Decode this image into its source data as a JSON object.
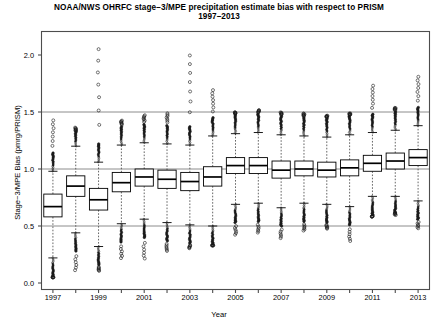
{
  "title": {
    "line1": "NOAA/NWS OHRFC stage−3/MPE precipitation estimate bias with respect to PRISM",
    "line2": "1997–2013"
  },
  "axes": {
    "xlabel": "Year",
    "ylabel": "Stage−3/MPE Bias (pmrg/PRISM)",
    "ytick_labels": [
      "0.0",
      "0.5",
      "1.0",
      "1.5",
      "2.0"
    ],
    "xtick_labels": [
      "1997",
      "1999",
      "2001",
      "2003",
      "2005",
      "2007",
      "2009",
      "2011",
      "2013"
    ]
  },
  "colors": {
    "frame": "#4d4d4d",
    "box": "#000000",
    "gridline": "#808080",
    "whisker": "#555555",
    "outlier": "#1a1a1a",
    "background": "#ffffff"
  },
  "chart_data": {
    "type": "boxplot",
    "title": "NOAA/NWS OHRFC stage−3/MPE precipitation estimate bias with respect to PRISM 1997–2013",
    "xlabel": "Year",
    "ylabel": "Stage−3/MPE Bias (pmrg/PRISM)",
    "ylim": [
      -0.05,
      2.25
    ],
    "yticks": [
      0.0,
      0.5,
      1.0,
      1.5,
      2.0
    ],
    "gridlines_y": [
      0.5,
      1.0,
      1.5
    ],
    "grid": true,
    "legend": "none",
    "categories": [
      1997,
      1998,
      1999,
      2000,
      2001,
      2002,
      2003,
      2004,
      2005,
      2006,
      2007,
      2008,
      2009,
      2010,
      2011,
      2012,
      2013
    ],
    "boxes": [
      {
        "year": 1997,
        "lower_whisker": 0.22,
        "q1": 0.58,
        "median": 0.67,
        "q3": 0.78,
        "upper_whisker": 0.98,
        "outliers_high_max": 1.46,
        "outliers_low_min": 0.05
      },
      {
        "year": 1998,
        "lower_whisker": 0.44,
        "q1": 0.76,
        "median": 0.85,
        "q3": 0.94,
        "upper_whisker": 1.2,
        "outliers_high_max": 1.33,
        "outliers_low_min": 0.09
      },
      {
        "year": 1999,
        "lower_whisker": 0.32,
        "q1": 0.64,
        "median": 0.73,
        "q3": 0.83,
        "upper_whisker": 1.06,
        "outliers_high_max": 2.15,
        "outliers_low_min": 0.1
      },
      {
        "year": 2000,
        "lower_whisker": 0.52,
        "q1": 0.8,
        "median": 0.88,
        "q3": 0.97,
        "upper_whisker": 1.21,
        "outliers_high_max": 1.43,
        "outliers_low_min": 0.2
      },
      {
        "year": 2001,
        "lower_whisker": 0.56,
        "q1": 0.85,
        "median": 0.93,
        "q3": 1.0,
        "upper_whisker": 1.23,
        "outliers_high_max": 1.48,
        "outliers_low_min": 0.19
      },
      {
        "year": 2002,
        "lower_whisker": 0.53,
        "q1": 0.83,
        "median": 0.91,
        "q3": 0.99,
        "upper_whisker": 1.22,
        "outliers_high_max": 1.5,
        "outliers_low_min": 0.27
      },
      {
        "year": 2003,
        "lower_whisker": 0.51,
        "q1": 0.81,
        "median": 0.89,
        "q3": 0.97,
        "upper_whisker": 1.21,
        "outliers_high_max": 2.07,
        "outliers_low_min": 0.3
      },
      {
        "year": 2004,
        "lower_whisker": 0.5,
        "q1": 0.85,
        "median": 0.93,
        "q3": 1.02,
        "upper_whisker": 1.29,
        "outliers_high_max": 1.72,
        "outliers_low_min": 0.33
      },
      {
        "year": 2005,
        "lower_whisker": 0.69,
        "q1": 0.96,
        "median": 1.03,
        "q3": 1.1,
        "upper_whisker": 1.31,
        "outliers_high_max": 1.5,
        "outliers_low_min": 0.41
      },
      {
        "year": 2006,
        "lower_whisker": 0.7,
        "q1": 0.96,
        "median": 1.03,
        "q3": 1.1,
        "upper_whisker": 1.32,
        "outliers_high_max": 1.52,
        "outliers_low_min": 0.43
      },
      {
        "year": 2007,
        "lower_whisker": 0.66,
        "q1": 0.92,
        "median": 0.99,
        "q3": 1.07,
        "upper_whisker": 1.3,
        "outliers_high_max": 1.5,
        "outliers_low_min": 0.38
      },
      {
        "year": 2008,
        "lower_whisker": 0.7,
        "q1": 0.94,
        "median": 1.0,
        "q3": 1.07,
        "upper_whisker": 1.29,
        "outliers_high_max": 1.49,
        "outliers_low_min": 0.45
      },
      {
        "year": 2009,
        "lower_whisker": 0.69,
        "q1": 0.93,
        "median": 0.99,
        "q3": 1.06,
        "upper_whisker": 1.28,
        "outliers_high_max": 1.47,
        "outliers_low_min": 0.47
      },
      {
        "year": 2010,
        "lower_whisker": 0.67,
        "q1": 0.94,
        "median": 1.01,
        "q3": 1.08,
        "upper_whisker": 1.3,
        "outliers_high_max": 1.49,
        "outliers_low_min": 0.35
      },
      {
        "year": 2011,
        "lower_whisker": 0.76,
        "q1": 0.98,
        "median": 1.05,
        "q3": 1.12,
        "upper_whisker": 1.32,
        "outliers_high_max": 1.76,
        "outliers_low_min": 0.58
      },
      {
        "year": 2012,
        "lower_whisker": 0.76,
        "q1": 1.0,
        "median": 1.07,
        "q3": 1.14,
        "upper_whisker": 1.34,
        "outliers_high_max": 1.54,
        "outliers_low_min": 0.62
      },
      {
        "year": 2013,
        "lower_whisker": 0.72,
        "q1": 1.03,
        "median": 1.1,
        "q3": 1.17,
        "upper_whisker": 1.38,
        "outliers_high_max": 1.84,
        "outliers_low_min": 0.47
      }
    ]
  }
}
